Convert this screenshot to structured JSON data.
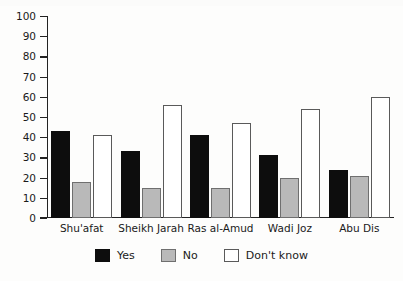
{
  "chart_data": {
    "type": "bar",
    "title": "",
    "xlabel": "",
    "ylabel": "",
    "ylim": [
      0,
      100
    ],
    "ytick_step": 10,
    "yticks": [
      100,
      90,
      80,
      70,
      60,
      50,
      40,
      30,
      20,
      10,
      0
    ],
    "grid": false,
    "legend_position": "bottom",
    "categories": [
      "Shu'afat",
      "Sheikh Jarah",
      "Ras al-Amud",
      "Wadi Joz",
      "Abu Dis"
    ],
    "series": [
      {
        "name": "Yes",
        "color": "#0d0d0d",
        "values": [
          43,
          33,
          41,
          31,
          24
        ]
      },
      {
        "name": "No",
        "color": "#b9b9b9",
        "values": [
          18,
          15,
          15,
          20,
          21
        ]
      },
      {
        "name": "Don't know",
        "color": "#ffffff",
        "values": [
          41,
          56,
          47,
          54,
          60
        ]
      }
    ]
  },
  "legend": {
    "items": [
      {
        "label": "Yes"
      },
      {
        "label": "No"
      },
      {
        "label": "Don't know"
      }
    ]
  }
}
